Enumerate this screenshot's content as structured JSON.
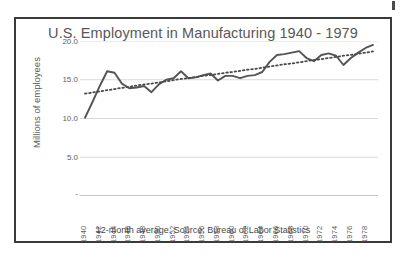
{
  "chart_data": {
    "type": "line",
    "title": "U.S. Employment in Manufacturing 1940 - 1979",
    "xlabel": "",
    "ylabel": "Millions of employees",
    "caption": "12-month average.  Source: Bureau of Labor Statistics",
    "ylim": [
      0,
      20
    ],
    "yticks": [
      "20.0",
      "15.0",
      "10.0",
      "5.0",
      "-"
    ],
    "ytick_values": [
      20.0,
      15.0,
      10.0,
      5.0,
      0
    ],
    "grid": true,
    "legend": "none",
    "xticks": [
      "1940",
      "1942",
      "1944",
      "1946",
      "1948",
      "1950",
      "1952",
      "1954",
      "1956",
      "1958",
      "1960",
      "1962",
      "1964",
      "1966",
      "1968",
      "1970",
      "1972",
      "1974",
      "1976",
      "1978"
    ],
    "x": [
      1940,
      1941,
      1942,
      1943,
      1944,
      1945,
      1946,
      1947,
      1948,
      1949,
      1950,
      1951,
      1952,
      1953,
      1954,
      1955,
      1956,
      1957,
      1958,
      1959,
      1960,
      1961,
      1962,
      1963,
      1964,
      1965,
      1966,
      1967,
      1968,
      1969,
      1970,
      1971,
      1972,
      1973,
      1974,
      1975,
      1976,
      1977,
      1978,
      1979
    ],
    "series": [
      {
        "name": "Manufacturing employment",
        "style": "solid",
        "color": "#555555",
        "values": [
          10.1,
          12.1,
          14.2,
          16.1,
          15.9,
          14.5,
          13.9,
          14.0,
          14.2,
          13.4,
          14.4,
          15.0,
          15.2,
          16.1,
          15.2,
          15.3,
          15.6,
          15.8,
          14.9,
          15.5,
          15.5,
          15.2,
          15.5,
          15.6,
          16.0,
          17.3,
          18.2,
          18.3,
          18.5,
          18.7,
          17.8,
          17.4,
          18.2,
          18.4,
          18.1,
          16.9,
          17.8,
          18.5,
          19.1,
          19.5
        ]
      },
      {
        "name": "Linear trend",
        "style": "dotted",
        "color": "#4a4a4a",
        "values": [
          13.2,
          13.35,
          13.5,
          13.65,
          13.8,
          13.95,
          14.1,
          14.25,
          14.4,
          14.5,
          14.65,
          14.8,
          14.95,
          15.1,
          15.2,
          15.35,
          15.5,
          15.6,
          15.75,
          15.9,
          16.0,
          16.15,
          16.3,
          16.4,
          16.55,
          16.7,
          16.85,
          17.0,
          17.1,
          17.25,
          17.4,
          17.55,
          17.65,
          17.8,
          17.95,
          18.1,
          18.2,
          18.35,
          18.5,
          18.65
        ]
      }
    ]
  }
}
